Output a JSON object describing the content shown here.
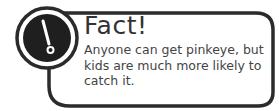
{
  "callout": {
    "icon": "exclamation-icon",
    "title": "Fact!",
    "body": "Anyone can get pinkeye, but kids are much more likely to catch it.",
    "colors": {
      "border": "#2b2b2b",
      "icon_fill": "#1f1f1f",
      "icon_glyph": "#ffffff",
      "text": "#444444"
    }
  }
}
